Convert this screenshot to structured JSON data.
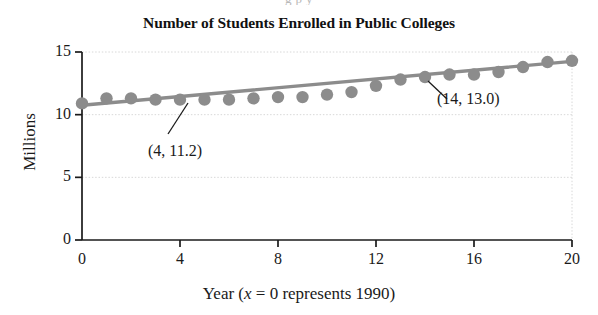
{
  "figure": {
    "top_bleed_text": "g  p  y",
    "background": "#ffffff"
  },
  "chart_data": {
    "type": "scatter",
    "title": "Number of Students Enrolled in Public Colleges",
    "xlabel_prefix": "Year (",
    "xlabel_italic": "x",
    "xlabel_suffix": " = 0 represents 1990)",
    "xlabel": "Year (x = 0 represents 1990)",
    "ylabel": "Millions",
    "xlim": [
      0,
      20
    ],
    "ylim": [
      0,
      15
    ],
    "xticks": [
      0,
      4,
      8,
      12,
      16,
      20
    ],
    "xtick_labels": [
      "0",
      "4",
      "8",
      "12",
      "16",
      "20"
    ],
    "yticks": [
      0,
      5,
      10,
      15
    ],
    "ytick_labels": [
      "0",
      "5",
      "10",
      "15"
    ],
    "grid": "dotted-light",
    "legend": "none",
    "marker_color": "#8c8c8c",
    "line_color": "#8c8c8c",
    "axis_color": "#1a1a1a",
    "x": [
      0,
      1,
      2,
      3,
      4,
      5,
      6,
      7,
      8,
      9,
      10,
      11,
      12,
      13,
      14,
      15,
      16,
      17,
      18,
      19,
      20
    ],
    "values": [
      10.9,
      11.3,
      11.3,
      11.2,
      11.2,
      11.2,
      11.2,
      11.3,
      11.4,
      11.4,
      11.6,
      11.8,
      12.3,
      12.8,
      13.0,
      13.2,
      13.2,
      13.4,
      13.8,
      14.2,
      14.3
    ],
    "trendline": {
      "type": "linear",
      "x": [
        0,
        20
      ],
      "y": [
        10.75,
        14.25
      ]
    },
    "annotations": [
      {
        "label": "(4, 11.2)",
        "point_x": 4,
        "point_y": 11.2,
        "text_x_px": 148,
        "text_y_px": 142,
        "leader_from_px": [
          188,
          103
        ],
        "leader_to_px": [
          168,
          134
        ]
      },
      {
        "label": "(14, 13.0)",
        "point_x": 14,
        "point_y": 13.0,
        "text_x_px": 437,
        "text_y_px": 90,
        "leader_from_px": [
          428,
          81
        ],
        "leader_to_px": [
          447,
          99
        ]
      }
    ]
  }
}
